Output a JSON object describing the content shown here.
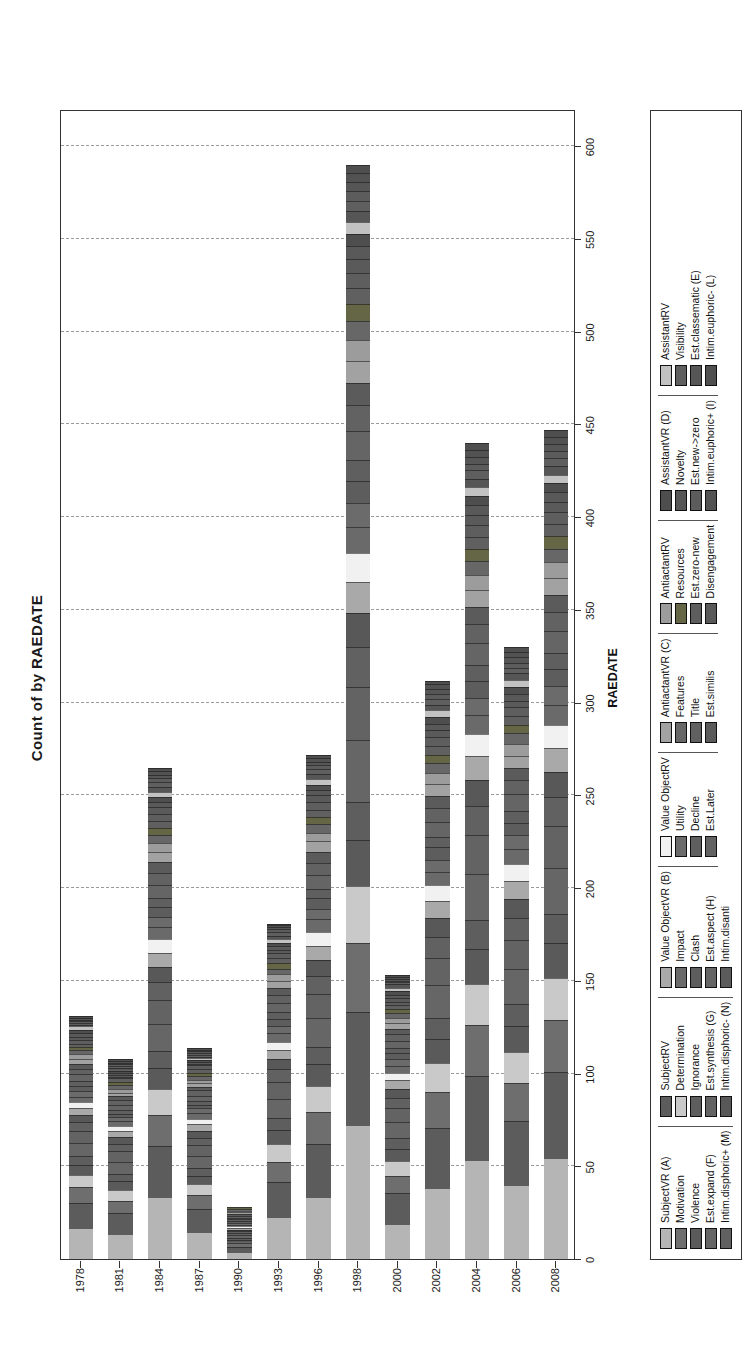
{
  "title": "Count of  by RAEDATE",
  "axes": {
    "y_title": "Count",
    "x_title": "RAEDATE",
    "y_ticks": [
      "0",
      "50",
      "100",
      "150",
      "200",
      "250",
      "300",
      "350",
      "400",
      "450",
      "500",
      "550",
      "600"
    ],
    "x_ticks": [
      "1978",
      "1981",
      "1984",
      "1987",
      "1990",
      "1993",
      "1996",
      "1998",
      "2000",
      "2002",
      "2004",
      "2006",
      "2008"
    ]
  },
  "chart_data": {
    "type": "bar",
    "orientation": "vertical-stacked-rotated",
    "title": "Count of  by RAEDATE",
    "xlabel": "RAEDATE",
    "ylabel": "Count",
    "ylim": [
      0,
      620
    ],
    "grid": true,
    "legend_position": "bottom",
    "categories": [
      "1978",
      "1981",
      "1984",
      "1987",
      "1990",
      "1993",
      "1996",
      "1998",
      "2000",
      "2002",
      "2004",
      "2006",
      "2008"
    ],
    "totals": [
      131,
      108,
      265,
      114,
      28,
      181,
      272,
      590,
      153,
      312,
      440,
      330,
      447
    ],
    "series": [
      {
        "name": "SubjectVR (A)",
        "values": [
          18,
          14,
          36,
          15,
          4,
          24,
          35,
          78,
          20,
          41,
          58,
          43,
          59
        ]
      },
      {
        "name": "SubjectRV",
        "values": [
          15,
          12,
          30,
          13,
          3,
          20,
          30,
          66,
          17,
          35,
          49,
          37,
          50
        ]
      },
      {
        "name": "Motivation",
        "values": [
          9,
          7,
          18,
          8,
          2,
          12,
          18,
          40,
          10,
          21,
          30,
          22,
          30
        ]
      },
      {
        "name": "Determination",
        "values": [
          7,
          6,
          15,
          6,
          1,
          10,
          15,
          33,
          8,
          17,
          24,
          18,
          25
        ]
      },
      {
        "name": "Violence",
        "values": [
          6,
          5,
          12,
          5,
          1,
          8,
          12,
          27,
          7,
          14,
          20,
          15,
          20
        ]
      },
      {
        "name": "Ignorance",
        "values": [
          5,
          4,
          10,
          4,
          1,
          7,
          10,
          22,
          6,
          12,
          17,
          13,
          17
        ]
      },
      {
        "name": "Est.expand (F)",
        "values": [
          8,
          7,
          16,
          7,
          2,
          11,
          16,
          36,
          9,
          19,
          27,
          20,
          27
        ]
      },
      {
        "name": "Est.synthesis (G)",
        "values": [
          7,
          6,
          14,
          6,
          1,
          10,
          14,
          31,
          8,
          16,
          23,
          17,
          24
        ]
      },
      {
        "name": "Intim.disphoric+ (M)",
        "values": [
          5,
          4,
          10,
          4,
          1,
          7,
          10,
          23,
          6,
          12,
          17,
          13,
          17
        ]
      },
      {
        "name": "Intim.disphoric- (N)",
        "values": [
          4,
          4,
          9,
          4,
          1,
          6,
          9,
          20,
          5,
          11,
          15,
          11,
          15
        ]
      },
      {
        "name": "Value ObjectVR (B)",
        "values": [
          4,
          3,
          8,
          4,
          1,
          5,
          8,
          18,
          5,
          10,
          14,
          10,
          14
        ]
      },
      {
        "name": "Value ObjectRV",
        "values": [
          4,
          3,
          8,
          3,
          1,
          5,
          8,
          17,
          4,
          9,
          13,
          10,
          13
        ]
      },
      {
        "name": "Impact",
        "values": [
          3,
          3,
          7,
          3,
          1,
          5,
          7,
          15,
          4,
          8,
          11,
          9,
          12
        ]
      },
      {
        "name": "Utility",
        "values": [
          3,
          2,
          6,
          3,
          1,
          4,
          6,
          14,
          4,
          7,
          10,
          8,
          11
        ]
      },
      {
        "name": "Clash",
        "values": [
          3,
          2,
          6,
          2,
          1,
          4,
          6,
          13,
          3,
          7,
          10,
          7,
          10
        ]
      },
      {
        "name": "Decline",
        "values": [
          3,
          2,
          5,
          2,
          1,
          4,
          5,
          12,
          3,
          6,
          9,
          7,
          9
        ]
      },
      {
        "name": "Est.aspect (H)",
        "values": [
          4,
          3,
          8,
          3,
          1,
          5,
          8,
          17,
          4,
          9,
          13,
          10,
          13
        ]
      },
      {
        "name": "Est.Later",
        "values": [
          3,
          3,
          7,
          3,
          1,
          5,
          7,
          15,
          4,
          8,
          11,
          8,
          11
        ]
      },
      {
        "name": "Intim.disanti",
        "values": [
          3,
          2,
          6,
          2,
          1,
          4,
          6,
          13,
          3,
          7,
          10,
          7,
          10
        ]
      },
      {
        "name": "AntiactantVR (C)",
        "values": [
          3,
          2,
          6,
          2,
          1,
          4,
          6,
          13,
          3,
          7,
          10,
          7,
          10
        ]
      },
      {
        "name": "AntiactantRV",
        "values": [
          3,
          2,
          5,
          2,
          1,
          4,
          5,
          12,
          3,
          6,
          9,
          7,
          9
        ]
      },
      {
        "name": "Features",
        "values": [
          2,
          2,
          5,
          2,
          1,
          3,
          5,
          11,
          3,
          6,
          8,
          6,
          8
        ]
      },
      {
        "name": "Resources",
        "values": [
          2,
          2,
          4,
          2,
          1,
          3,
          4,
          10,
          2,
          5,
          7,
          5,
          7
        ]
      },
      {
        "name": "Title",
        "values": [
          2,
          2,
          4,
          2,
          0,
          3,
          4,
          9,
          2,
          5,
          7,
          5,
          7
        ]
      },
      {
        "name": "Est.zero-new",
        "values": [
          2,
          1,
          4,
          2,
          0,
          3,
          4,
          9,
          2,
          5,
          7,
          5,
          7
        ]
      },
      {
        "name": "Est.similis",
        "values": [
          2,
          1,
          4,
          1,
          0,
          2,
          4,
          8,
          2,
          4,
          6,
          4,
          6
        ]
      },
      {
        "name": "Disengagement",
        "values": [
          2,
          1,
          3,
          1,
          0,
          2,
          3,
          8,
          2,
          4,
          6,
          4,
          6
        ]
      },
      {
        "name": "AssistantVR (D)",
        "values": [
          2,
          1,
          3,
          1,
          0,
          2,
          3,
          7,
          2,
          4,
          5,
          4,
          5
        ]
      },
      {
        "name": "AssistantRV",
        "values": [
          2,
          1,
          3,
          1,
          0,
          2,
          3,
          7,
          2,
          4,
          5,
          4,
          5
        ]
      },
      {
        "name": "Novelty",
        "values": [
          1,
          1,
          3,
          1,
          0,
          2,
          3,
          6,
          2,
          3,
          5,
          4,
          5
        ]
      },
      {
        "name": "Visibility",
        "values": [
          1,
          1,
          3,
          1,
          0,
          2,
          3,
          6,
          1,
          3,
          5,
          3,
          5
        ]
      },
      {
        "name": "Est.new->zero",
        "values": [
          1,
          1,
          2,
          1,
          0,
          2,
          2,
          6,
          1,
          3,
          4,
          3,
          4
        ]
      },
      {
        "name": "Est.classematic (E)",
        "values": [
          1,
          1,
          2,
          1,
          0,
          1,
          2,
          5,
          1,
          3,
          4,
          3,
          4
        ]
      },
      {
        "name": "Intim.euphoric+ (I)",
        "values": [
          1,
          1,
          2,
          1,
          0,
          1,
          2,
          5,
          1,
          3,
          4,
          3,
          4
        ]
      },
      {
        "name": "Intim.euphoric- (L)",
        "values": [
          1,
          1,
          2,
          1,
          0,
          1,
          2,
          5,
          1,
          2,
          4,
          3,
          4
        ]
      }
    ]
  },
  "legend": {
    "columns": [
      {
        "items": [
          {
            "label": "SubjectVR (A)",
            "color": "#b5b5b5"
          },
          {
            "label": "Motivation",
            "color": "#6e6e6e"
          },
          {
            "label": "Violence",
            "color": "#5a5a5a"
          },
          {
            "label": "Est.expand (F)",
            "color": "#666666"
          },
          {
            "label": "Intim.disphoric+ (M)",
            "color": "#616161"
          }
        ]
      },
      {
        "items": [
          {
            "label": "SubjectRV",
            "color": "#5c5c5c"
          },
          {
            "label": "Determination",
            "color": "#c9c9c9"
          },
          {
            "label": "Ignorance",
            "color": "#5e5e5e"
          },
          {
            "label": "Est.synthesis (G)",
            "color": "#636363"
          },
          {
            "label": "Intim.disphoric- (N)",
            "color": "#585858"
          }
        ]
      },
      {
        "items": [
          {
            "label": "Value ObjectVR (B)",
            "color": "#a9a9a9"
          },
          {
            "label": "Impact",
            "color": "#6a6a6a"
          },
          {
            "label": "Clash",
            "color": "#5d5d5d"
          },
          {
            "label": "Est.aspect (H)",
            "color": "#656565"
          },
          {
            "label": "Intim.disanti",
            "color": "#5b5b5b"
          }
        ]
      },
      {
        "items": [
          {
            "label": "Value ObjectRV",
            "color": "#f1f1f1"
          },
          {
            "label": "Utility",
            "color": "#6b6b6b"
          },
          {
            "label": "Decline",
            "color": "#5f5f5f"
          },
          {
            "label": "Est.Later",
            "color": "#626262"
          }
        ]
      },
      {
        "items": [
          {
            "label": "AntiactantVR (C)",
            "color": "#a2a2a2"
          },
          {
            "label": "Features",
            "color": "#676767"
          },
          {
            "label": "Title",
            "color": "#606060"
          },
          {
            "label": "Est.similis",
            "color": "#5a5a5a"
          }
        ]
      },
      {
        "items": [
          {
            "label": "AntiactantRV",
            "color": "#9c9c9c"
          },
          {
            "label": "Resources",
            "color": "#646646"
          },
          {
            "label": "Est.zero-new",
            "color": "#5e5e5e"
          },
          {
            "label": "Disengagement",
            "color": "#595959"
          }
        ]
      },
      {
        "items": [
          {
            "label": "AssistantVR (D)",
            "color": "#4e4e4e"
          },
          {
            "label": "Novelty",
            "color": "#565656"
          },
          {
            "label": "Est.new->zero",
            "color": "#5c5c5c"
          },
          {
            "label": "Intim.euphoric+ (I)",
            "color": "#525252"
          }
        ]
      },
      {
        "items": [
          {
            "label": "AssistantRV",
            "color": "#c2c2c2"
          },
          {
            "label": "Visibility",
            "color": "#5f5f5f"
          },
          {
            "label": "Est.classematic (E)",
            "color": "#565656"
          },
          {
            "label": "Intim.euphoric- (L)",
            "color": "#4f4f4f"
          }
        ]
      }
    ]
  }
}
